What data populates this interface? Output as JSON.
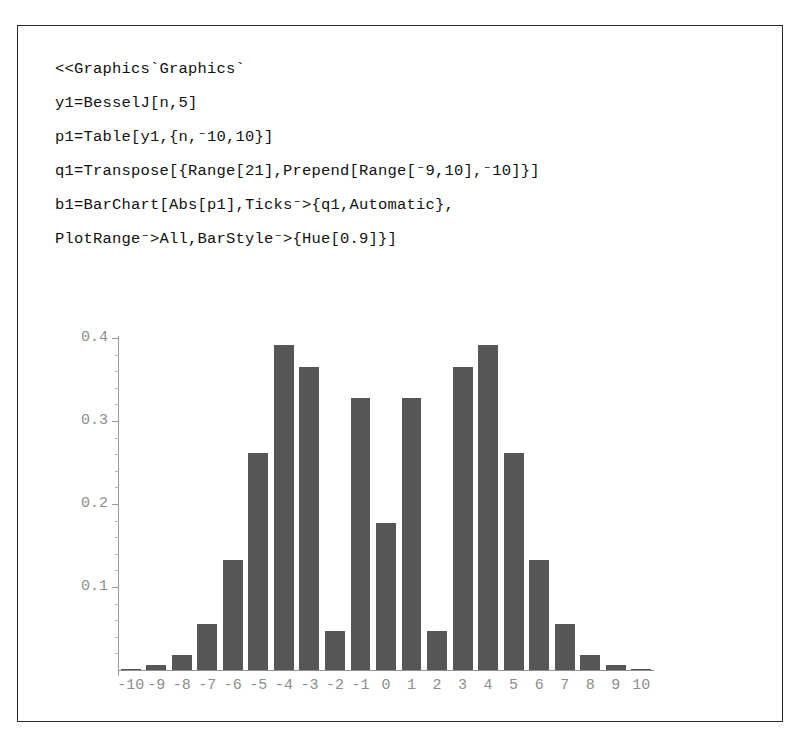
{
  "document": {
    "kind": "mathematica-notebook-cell",
    "background_color": "#ffffff",
    "frame_color": "#2a2a2a"
  },
  "code": {
    "lines": [
      "<<Graphics`Graphics`",
      "y1=BesselJ[n,5]",
      "p1=Table[y1,{n,⁻10,10}]",
      "q1=Transpose[{Range[21],Prepend[Range[⁻9,10],⁻10]}]",
      "b1=BarChart[Abs[p1],Ticks⁻>{q1,Automatic},",
      "PlotRange⁻>All,BarStyle⁻>{Hue[0.9]}]"
    ]
  },
  "chart_data": {
    "type": "bar",
    "title": "",
    "xlabel": "",
    "ylabel": "",
    "bar_color": "#565656",
    "axis_color": "#9a9a9a",
    "tick_label_color": "#8d8d8d",
    "grid": false,
    "legend": false,
    "ylim": [
      0,
      0.4
    ],
    "xlim": [
      -10.5,
      10.5
    ],
    "y_ticks_major": [
      0.1,
      0.2,
      0.3,
      0.4
    ],
    "y_tick_labels": [
      "0.1",
      "0.2",
      "0.3",
      "0.4"
    ],
    "y_ticks_minor_step": 0.02,
    "categories": [
      "-10",
      "-9",
      "-8",
      "-7",
      "-6",
      "-5",
      "-4",
      "-3",
      "-2",
      "-1",
      "0",
      "1",
      "2",
      "3",
      "4",
      "5",
      "6",
      "7",
      "8",
      "9",
      "10"
    ],
    "values": [
      0.0015,
      0.0055,
      0.0184,
      0.055,
      0.1321,
      0.2611,
      0.3912,
      0.3648,
      0.0466,
      0.3276,
      0.1776,
      0.3276,
      0.0466,
      0.3648,
      0.3912,
      0.2611,
      0.1321,
      0.055,
      0.0184,
      0.0055,
      0.0015
    ],
    "series_description": "Abs[BesselJ[n,5]] for n = -10..10"
  }
}
